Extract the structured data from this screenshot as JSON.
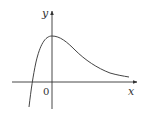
{
  "figure": {
    "type": "function-graph",
    "axes": {
      "x_label": "x",
      "y_label": "y",
      "origin_label": "0"
    },
    "curve": {
      "description": "Curve rising steeply from below the x-axis, crossing the x-axis left of origin, peaking at the y-axis, then decaying toward the x-axis as x increases"
    },
    "colors": {
      "axis": "#333333",
      "curve": "#444444",
      "background": "#ffffff"
    }
  }
}
